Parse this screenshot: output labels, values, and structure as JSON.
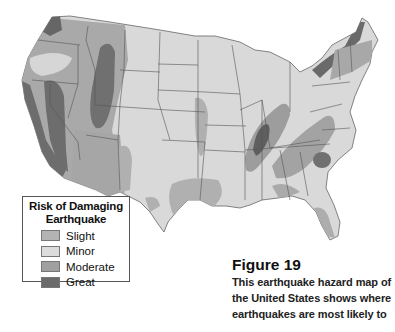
{
  "map": {
    "title": "Earthquake hazard map of the United States",
    "region": "Contiguous United States",
    "colors": {
      "background": "#ffffff",
      "slight": "#b3b3b3",
      "minor": "#d9d9d9",
      "moderate": "#9c9c9c",
      "great": "#6b6b6b",
      "state_border": "#555555"
    }
  },
  "legend": {
    "title_line1": "Risk of Damaging",
    "title_line2": "Earthquake",
    "items": [
      {
        "label": "Slight",
        "color": "#b3b3b3"
      },
      {
        "label": "Minor",
        "color": "#dcdcdc"
      },
      {
        "label": "Moderate",
        "color": "#a0a0a0"
      },
      {
        "label": "Great",
        "color": "#6b6b6b"
      }
    ]
  },
  "caption": {
    "figure": "Figure 19",
    "lines": [
      "This earthquake hazard map of",
      "the United States shows where",
      "earthquakes are most likely to"
    ]
  }
}
